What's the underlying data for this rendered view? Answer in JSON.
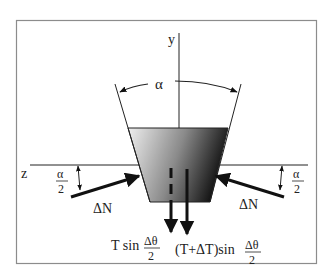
{
  "diagram": {
    "labels": {
      "y_axis": "y",
      "z_axis": "z",
      "alpha": "α",
      "half_alpha_num": "α",
      "half_alpha_den": "2",
      "normal_force_left": "ΔN",
      "normal_force_right": "ΔN",
      "tension_left_prefix": "T sin",
      "tension_right_prefix": "(T+ΔT)sin",
      "dtheta_num": "Δθ",
      "dtheta_den": "2"
    },
    "colors": {
      "frame": "#888888",
      "ink": "#111111",
      "gradient_light": "#e8e8e8",
      "gradient_dark": "#1a1a1a"
    }
  }
}
